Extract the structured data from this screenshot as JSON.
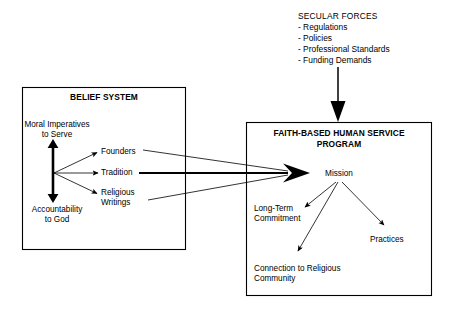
{
  "diagram": {
    "type": "flow-diagram",
    "title_implicit": "Belief System and Secular Forces influencing a Faith-Based Human Service Program",
    "secular_forces": {
      "heading": "SECULAR FORCES",
      "items": [
        "- Regulations",
        "- Policies",
        "- Professional Standards",
        "- Funding Demands"
      ]
    },
    "belief_system": {
      "heading": "BELIEF SYSTEM",
      "axis_top_label_line1": "Moral Imperatives",
      "axis_top_label_line2": "to Serve",
      "axis_bottom_label_line1": "Accountability",
      "axis_bottom_label_line2": "to God",
      "channels": [
        "Founders",
        "Tradition",
        "Religious",
        "Writings"
      ]
    },
    "program": {
      "heading_line1": "FAITH-BASED HUMAN SERVICE",
      "heading_line2": "PROGRAM",
      "center_node": "Mission",
      "outcomes": [
        {
          "line1": "Long-Term",
          "line2": "Commitment"
        },
        {
          "line1": "Connection to Religious",
          "line2": "Community"
        },
        {
          "line1": "Practices",
          "line2": ""
        }
      ]
    },
    "colors": {
      "stroke": "#000000",
      "text": "#000000",
      "background": "#ffffff"
    }
  }
}
